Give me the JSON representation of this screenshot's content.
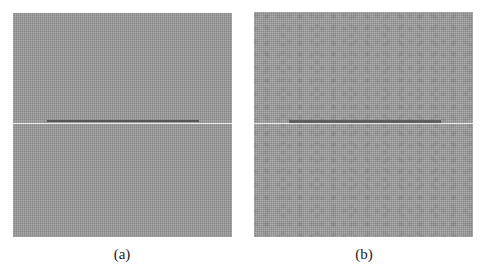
{
  "figure": {
    "panels": [
      {
        "id": "a",
        "label": "(a)",
        "background_color": "#9b9b9b",
        "white_line_y": 110,
        "dark_bar": {
          "x_start": 34,
          "x_end": 186,
          "y": 107,
          "color": "#555555"
        }
      },
      {
        "id": "b",
        "label": "(b)",
        "background_color": "#a0a0a0",
        "white_line_y": 111,
        "dark_bar": {
          "x_start": 35,
          "x_end": 187,
          "y": 108,
          "color": "#5e5e5e"
        }
      }
    ]
  }
}
